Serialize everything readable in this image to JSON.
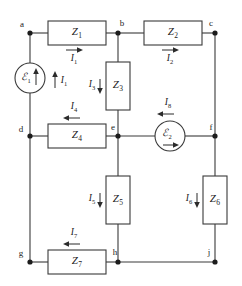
{
  "diagram": {
    "type": "electrical-circuit-schematic",
    "stroke_color": "#3a3a3a",
    "text_color": "#1c1c1c",
    "background": "#ffffff",
    "nodes": [
      {
        "id": "a",
        "label": "a",
        "x": 30,
        "y": 33,
        "label_x": 24,
        "label_y": 25
      },
      {
        "id": "b",
        "label": "b",
        "x": 118,
        "y": 33,
        "label_x": 120,
        "label_y": 24
      },
      {
        "id": "c",
        "label": "c",
        "x": 215,
        "y": 33,
        "label_x": 212,
        "label_y": 24
      },
      {
        "id": "d",
        "label": "d",
        "x": 30,
        "y": 136,
        "label_x": 22,
        "label_y": 130
      },
      {
        "id": "e",
        "label": "e",
        "x": 118,
        "y": 136,
        "label_x": 115,
        "label_y": 128
      },
      {
        "id": "f",
        "label": "f",
        "x": 215,
        "y": 136,
        "label_x": 212,
        "label_y": 128
      },
      {
        "id": "g",
        "label": "g",
        "x": 30,
        "y": 262,
        "label_x": 23,
        "label_y": 254
      },
      {
        "id": "h",
        "label": "h",
        "x": 118,
        "y": 262,
        "label_x": 116,
        "label_y": 253
      },
      {
        "id": "j",
        "label": "j",
        "x": 215,
        "y": 262,
        "label_x": 210,
        "label_y": 253
      }
    ],
    "impedances": [
      {
        "id": "Z1",
        "symbol": "Z",
        "subscript": "1",
        "orientation": "horizontal",
        "x": 48,
        "y": 21,
        "w": 58,
        "h": 24
      },
      {
        "id": "Z2",
        "symbol": "Z",
        "subscript": "2",
        "orientation": "horizontal",
        "x": 144,
        "y": 21,
        "w": 58,
        "h": 24
      },
      {
        "id": "Z3",
        "symbol": "Z",
        "subscript": "3",
        "orientation": "vertical",
        "x": 106,
        "y": 62,
        "w": 24,
        "h": 48
      },
      {
        "id": "Z4",
        "symbol": "Z",
        "subscript": "4",
        "orientation": "horizontal",
        "x": 48,
        "y": 124,
        "w": 58,
        "h": 24
      },
      {
        "id": "Z5",
        "symbol": "Z",
        "subscript": "5",
        "orientation": "vertical",
        "x": 106,
        "y": 176,
        "w": 24,
        "h": 48
      },
      {
        "id": "Z6",
        "symbol": "Z",
        "subscript": "6",
        "orientation": "vertical",
        "x": 203,
        "y": 176,
        "w": 24,
        "h": 48
      },
      {
        "id": "Z7",
        "symbol": "Z",
        "subscript": "7",
        "orientation": "horizontal",
        "x": 48,
        "y": 250,
        "w": 58,
        "h": 24
      }
    ],
    "sources": [
      {
        "id": "E1",
        "symbol": "ℰ",
        "subscript": "1",
        "x": 30,
        "y": 78,
        "r": 15,
        "internal_arrow": "up",
        "note": "emf source on left branch between a and d"
      },
      {
        "id": "E2",
        "symbol": "ℰ",
        "subscript": "2",
        "x": 170,
        "y": 136,
        "r": 15,
        "internal_arrow": "right",
        "note": "emf source on middle rail between e and f"
      }
    ],
    "currents": [
      {
        "id": "I1",
        "symbol": "I",
        "subscript": "1",
        "direction": "right",
        "label_x": 72,
        "label_y": 58,
        "arrow_x": 66,
        "arrow_y": 50,
        "arrow_len": 16
      },
      {
        "id": "I1b",
        "symbol": "I",
        "subscript": "1",
        "direction": "up",
        "label_x": 62,
        "label_y": 81,
        "arrow_x": 55,
        "arrow_y": 86,
        "arrow_len": 16
      },
      {
        "id": "I2",
        "symbol": "I",
        "subscript": "2",
        "direction": "right",
        "label_x": 168,
        "label_y": 58,
        "arrow_x": 162,
        "arrow_y": 50,
        "arrow_len": 16
      },
      {
        "id": "I3",
        "symbol": "I",
        "subscript": "3",
        "direction": "down",
        "label_x": 90,
        "label_y": 86,
        "arrow_x": 100,
        "arrow_y": 79,
        "arrow_len": 16
      },
      {
        "id": "I4",
        "symbol": "I",
        "subscript": "4",
        "direction": "left",
        "label_x": 72,
        "label_y": 108,
        "arrow_x": 66,
        "arrow_y": 118,
        "arrow_len": 16
      },
      {
        "id": "I5",
        "symbol": "I",
        "subscript": "5",
        "direction": "down",
        "label_x": 90,
        "label_y": 200,
        "arrow_x": 100,
        "arrow_y": 193,
        "arrow_len": 16
      },
      {
        "id": "I6",
        "symbol": "I",
        "subscript": "6",
        "direction": "down",
        "label_x": 187,
        "label_y": 200,
        "arrow_x": 197,
        "arrow_y": 193,
        "arrow_len": 16
      },
      {
        "id": "I7",
        "symbol": "I",
        "subscript": "7",
        "direction": "left",
        "label_x": 72,
        "label_y": 234,
        "arrow_x": 66,
        "arrow_y": 244,
        "arrow_len": 16
      },
      {
        "id": "I8",
        "symbol": "I",
        "subscript": "8",
        "direction": "left",
        "label_x": 166,
        "label_y": 104,
        "arrow_x": 160,
        "arrow_y": 114,
        "arrow_len": 16
      }
    ]
  }
}
